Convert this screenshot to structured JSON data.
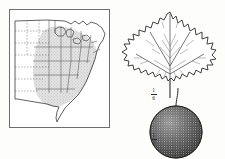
{
  "plate": {
    "title": "Platanus occidentalis plate",
    "background_color": "#fdfdfc",
    "ink_color": "#1a1a1a"
  },
  "map_figure": {
    "name": "range map of eastern United States",
    "frame_color": "#6e6e6e",
    "range_shading_color": "#c9c9c9",
    "state_line_color": "#555555",
    "coast_line_color": "#3a3a3a",
    "legend": "shaded area indicates natural range",
    "dashed_state_lines": true
  },
  "specimen_figure": {
    "leaf": {
      "name": "sycamore leaf",
      "description": "broad palmately lobed leaf with toothed margins",
      "lobes": 5,
      "vein_color": "#5a5a5a",
      "outline_color": "#2b2b2b"
    },
    "fruit": {
      "name": "spherical seed ball",
      "description": "stippled globose fruit head on a slender stalk",
      "stipple_color": "#3a3a3a",
      "outline_color": "#1f1f1f"
    }
  },
  "scales": [
    {
      "id": "leaf-scale",
      "numerator": "1",
      "denominator": "6"
    },
    {
      "id": "fruit-scale",
      "numerator": "1",
      "denominator": "2"
    }
  ]
}
